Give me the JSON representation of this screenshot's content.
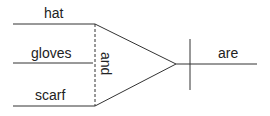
{
  "diagram": {
    "type": "sentence-diagram",
    "compound_subject": [
      "hat",
      "gloves",
      "scarf"
    ],
    "conjunction": "and",
    "verb": "are",
    "line_color": "#333333"
  }
}
